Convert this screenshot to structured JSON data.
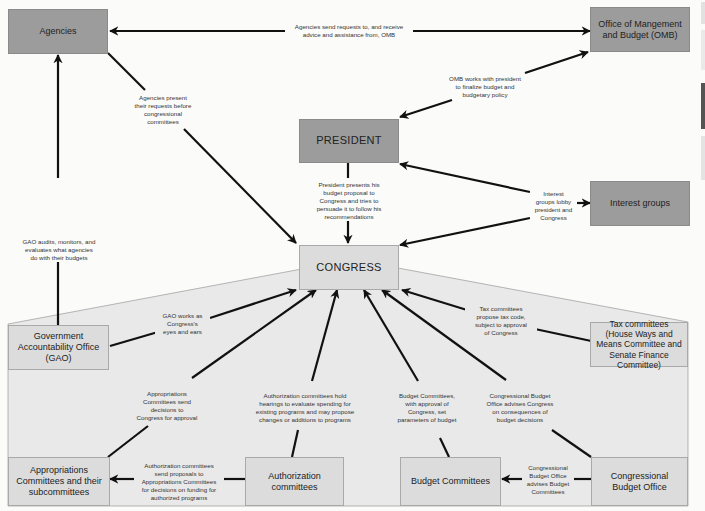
{
  "colors": {
    "background": "#fbfbfa",
    "dark_box": "#9c9c9c",
    "light_box": "#dcdcdc",
    "congress_zone": "#e9e9e9",
    "arrow": "#111111"
  },
  "nodes": {
    "agencies": "Agencies",
    "omb": "Office of Mangement and Budget (OMB)",
    "president": "PRESIDENT",
    "interest_groups": "Interest groups",
    "congress": "CONGRESS",
    "gao": "Government Accountability Office (GAO)",
    "tax_committees": "Tax committees (House Ways and Means Committee and Senate Finance Committee)",
    "appropriations": "Appropriations Committees and their subcommittees",
    "authorization": "Authorization committees",
    "budget_committees": "Budget Committees",
    "cbo": "Congressional Budget Office"
  },
  "edges": {
    "agencies_omb": "Agencies send requests to, and receive\nadvice and assistance from, OMB",
    "omb_president": "OMB works with president\nto finalize budget and\nbudgetary policy",
    "agencies_congress": "Agencies present\ntheir requests before\ncongressional\ncommittees",
    "president_congress": "President presents his\nbudget proposal to\nCongress and tries to\npersuade it to follow his\nrecommendations",
    "interest_groups": "Interest\ngroups lobby\npresident and\nCongress",
    "gao_agencies": "GAO audits, monitors, and\nevaluates what agencies\ndo with their budgets",
    "gao_congress": "GAO works as\nCongress's\neyes and ears",
    "tax_congress": "Tax committees\npropose tax code,\nsubject to approval\nof Congress",
    "appropriations_congress": "Appropriations\nCommittees send\ndecisions to\nCongress for approval",
    "authorization_congress": "Authorization committees hold\nhearings to evaluate spending for\nexisting programs and may propose\nchanges or additions to programs",
    "budget_congress": "Budget Committees,\nwith approval of\nCongress, set\nparameters of budget",
    "cbo_congress": "Congressional Budget\nOffice advises Congress\non consequences of\nbudget decisions",
    "authorization_appropriations": "Authorization committees\nsend proposals to\nAppropriations Committees\nfor decisions on funding for\nauthorized programs",
    "cbo_budget": "Congressional\nBudget Office\nadvises Budget\nCommittees"
  }
}
